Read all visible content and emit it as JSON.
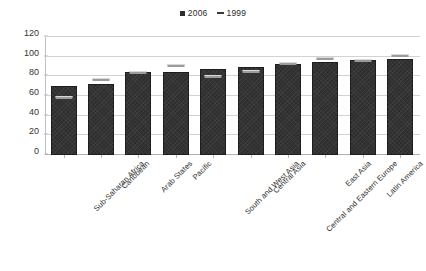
{
  "chart_data": {
    "type": "bar",
    "title": "",
    "xlabel": "",
    "ylabel": "",
    "ylim": [
      0,
      120
    ],
    "yticks": [
      0,
      20,
      40,
      60,
      80,
      100,
      120
    ],
    "grid": true,
    "legend_position": "top-center",
    "categories": [
      "Sub-Saharan Africa",
      "Caribbean",
      "Arab States",
      "Pacific",
      "South and West Asia",
      "Central Asia",
      "Central and Eastern Europe",
      "East Asia",
      "Latin America",
      "N. America and W. Europe"
    ],
    "series": [
      {
        "name": "2006",
        "marker": "square",
        "color": "#2e2e2e",
        "values": [
          70,
          72,
          84,
          84,
          87,
          90,
          93,
          95,
          97,
          98
        ]
      },
      {
        "name": "1999",
        "marker": "dash",
        "color": "#9b9b9b",
        "values": [
          58,
          77,
          84,
          91,
          80,
          85,
          93,
          98,
          96,
          101
        ]
      }
    ]
  },
  "legend": {
    "entries": [
      {
        "label": "2006"
      },
      {
        "label": "1999"
      }
    ]
  },
  "axis": {
    "y_tick_labels": [
      "0",
      "20",
      "40",
      "60",
      "80",
      "100",
      "120"
    ]
  }
}
